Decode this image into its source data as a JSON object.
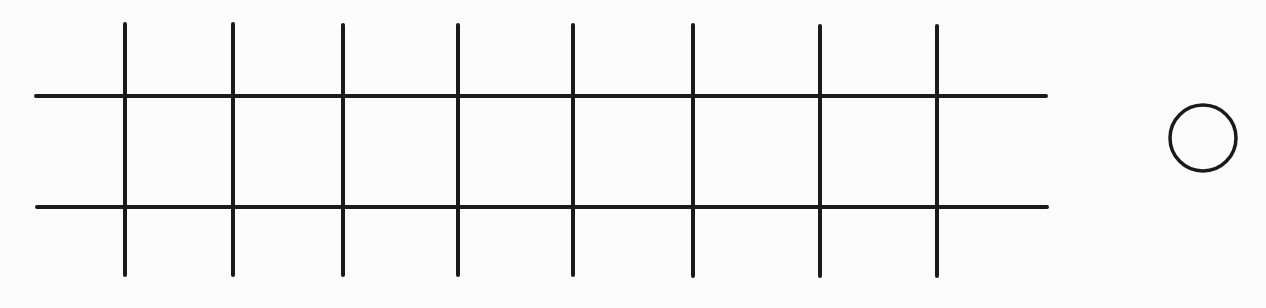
{
  "diagram": {
    "width": 1266,
    "height": 308,
    "background": "#fbfbfb",
    "stroke_color": "#1a1a1a",
    "stroke_width": 4,
    "horizontal_lines": [
      {
        "y": 96,
        "x1": 36,
        "x2": 1046
      },
      {
        "y": 207,
        "x1": 37,
        "x2": 1047
      }
    ],
    "vertical_lines": [
      {
        "x": 125,
        "y1": 24,
        "y2": 275
      },
      {
        "x": 233,
        "y1": 24,
        "y2": 275
      },
      {
        "x": 343,
        "y1": 25,
        "y2": 275
      },
      {
        "x": 458,
        "y1": 25,
        "y2": 275
      },
      {
        "x": 573,
        "y1": 25,
        "y2": 275
      },
      {
        "x": 693,
        "y1": 25,
        "y2": 276
      },
      {
        "x": 820,
        "y1": 26,
        "y2": 276
      },
      {
        "x": 937,
        "y1": 26,
        "y2": 276
      }
    ],
    "circle": {
      "cx": 1203,
      "cy": 138,
      "r": 33,
      "stroke_width": 3.5
    }
  }
}
